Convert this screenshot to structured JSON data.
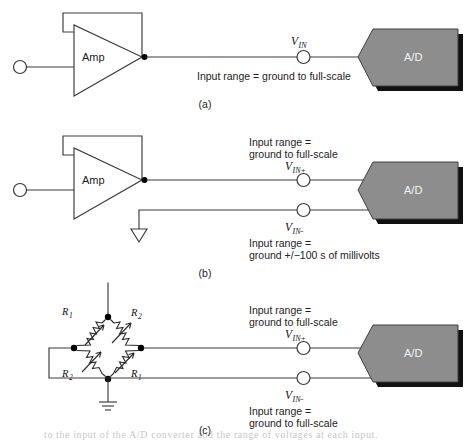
{
  "figure": {
    "background_color": "#ffffff",
    "line_color": "#3a3a3a",
    "adc_fill_color": "#8d8d8d",
    "adc_shadow_color": "#111111",
    "adc_text_color": "#f2f2f2"
  },
  "labels": {
    "amp": "Amp",
    "adc": "A/D",
    "v_letter": "V",
    "sub_in": "IN",
    "sub_in_plus": "IN+",
    "sub_in_minus": "IN-",
    "r_letter": "R",
    "sub_1": "1",
    "sub_2": "2"
  },
  "panels": [
    {
      "id": "a",
      "tag": "(a)",
      "amp_label": "Amp",
      "adc_label": "A/D",
      "signals": [
        {
          "name": "v-in",
          "var": "V",
          "subscript": "IN",
          "range_lines": [
            "Input range  =  ground to full-scale"
          ]
        }
      ]
    },
    {
      "id": "b",
      "tag": "(b)",
      "amp_label": "Amp",
      "adc_label": "A/D",
      "signals": [
        {
          "name": "v-in-plus",
          "var": "V",
          "subscript": "IN+",
          "range_lines": [
            "Input range  =",
            "ground to full-scale"
          ]
        },
        {
          "name": "v-in-minus",
          "var": "V",
          "subscript": "IN-",
          "range_lines": [
            "Input range  =",
            "ground +/−100 s of millivolts"
          ]
        }
      ]
    },
    {
      "id": "c",
      "tag": "(c)",
      "adc_label": "A/D",
      "bridge": {
        "resistors": [
          {
            "position": "top-left",
            "label": "R",
            "subscript": "1"
          },
          {
            "position": "top-right",
            "label": "R",
            "subscript": "2"
          },
          {
            "position": "bottom-left",
            "label": "R",
            "subscript": "2"
          },
          {
            "position": "bottom-right",
            "label": "R",
            "subscript": "1"
          }
        ]
      },
      "signals": [
        {
          "name": "v-in-plus",
          "var": "V",
          "subscript": "IN+",
          "range_lines": [
            "Input range  =",
            "ground to full-scale"
          ]
        },
        {
          "name": "v-in-minus",
          "var": "V",
          "subscript": "IN-",
          "range_lines": [
            "Input range  =",
            "ground to full-scale"
          ]
        }
      ]
    }
  ],
  "footer": {
    "cut_off_caption": "to the input of the A/D converter and the range of voltages at each input."
  }
}
